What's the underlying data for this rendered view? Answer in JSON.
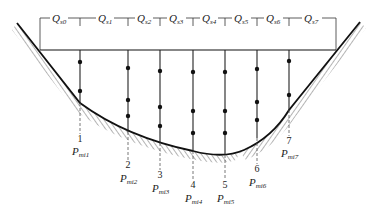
{
  "diagram": {
    "type": "river cross-section with velocity verticals",
    "colors": {
      "line": "#222222",
      "hatch": "#444444",
      "background": "#ffffff"
    },
    "partial_discharges": [
      {
        "symbol": "Q",
        "subscript": "s0",
        "x": 58
      },
      {
        "symbol": "Q",
        "subscript": "s1",
        "x": 104
      },
      {
        "symbol": "Q",
        "subscript": "s2",
        "x": 144
      },
      {
        "symbol": "Q",
        "subscript": "s3",
        "x": 176
      },
      {
        "symbol": "Q",
        "subscript": "s4",
        "x": 209
      },
      {
        "symbol": "Q",
        "subscript": "s5",
        "x": 241
      },
      {
        "symbol": "Q",
        "subscript": "s6",
        "x": 273
      },
      {
        "symbol": "Q",
        "subscript": "s7",
        "x": 311
      }
    ],
    "verticals": [
      {
        "number": "1",
        "label": "P",
        "subscript": "mi1",
        "x": 80,
        "bed_y": 103,
        "points": [
          62,
          91
        ],
        "num_y": 142,
        "lbl_y": 155
      },
      {
        "number": "2",
        "label": "P",
        "subscript": "mi2",
        "x": 128,
        "bed_y": 132,
        "points": [
          68,
          100,
          116
        ],
        "num_y": 168,
        "lbl_y": 182
      },
      {
        "number": "3",
        "label": "P",
        "subscript": "mi3",
        "x": 160,
        "bed_y": 143,
        "points": [
          71,
          107,
          126
        ],
        "num_y": 178,
        "lbl_y": 192
      },
      {
        "number": "4",
        "label": "P",
        "subscript": "mi4",
        "x": 193,
        "bed_y": 153,
        "points": [
          72,
          111,
          133
        ],
        "num_y": 188,
        "lbl_y": 202
      },
      {
        "number": "5",
        "label": "P",
        "subscript": "mi5",
        "x": 225,
        "bed_y": 154,
        "points": [
          72,
          111,
          133
        ],
        "num_y": 188,
        "lbl_y": 202
      },
      {
        "number": "6",
        "label": "P",
        "subscript": "mi6",
        "x": 257,
        "bed_y": 137,
        "points": [
          69,
          102,
          120
        ],
        "num_y": 172,
        "lbl_y": 186
      },
      {
        "number": "7",
        "label": "P",
        "subscript": "mi7",
        "x": 289,
        "bed_y": 108,
        "points": [
          61,
          95
        ],
        "num_y": 144,
        "lbl_y": 157
      }
    ]
  }
}
